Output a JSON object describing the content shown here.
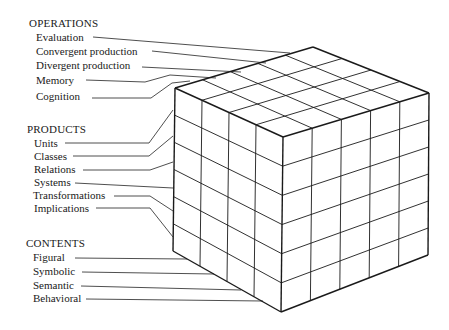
{
  "diagram": {
    "type": "structure-of-intellect-cube",
    "dimensions": {
      "operations": 5,
      "products": 6,
      "contents": 4
    },
    "line_color": "#1a1a1a",
    "background": "#ffffff"
  },
  "operations": {
    "heading": "OPERATIONS",
    "items": [
      "Evaluation",
      "Convergent production",
      "Divergent production",
      "Memory",
      "Cognition"
    ]
  },
  "products": {
    "heading": "PRODUCTS",
    "items": [
      "Units",
      "Classes",
      "Relations",
      "Systems",
      "Transformations",
      "Implications"
    ]
  },
  "contents": {
    "heading": "CONTENTS",
    "items": [
      "Figural",
      "Symbolic",
      "Semantic",
      "Behavioral"
    ]
  }
}
